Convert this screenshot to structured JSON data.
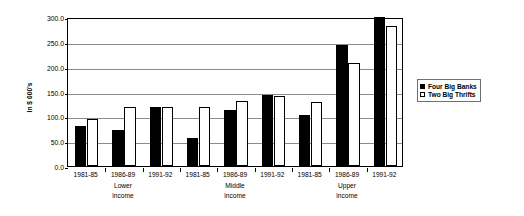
{
  "chart_data": {
    "type": "bar",
    "title": "",
    "subtitle": "",
    "xlabel": "",
    "ylabel": "In $ 000's",
    "ylim": [
      0,
      300
    ],
    "ytick_values": [
      0,
      50,
      100,
      150,
      200,
      250,
      300
    ],
    "ytick_labels": [
      "0.0",
      "50.0",
      "100.0",
      "150.0",
      "200.0",
      "250.0",
      "300.0"
    ],
    "grid": true,
    "legend_position": "right",
    "categories": [
      "1981-85",
      "1986-89",
      "1991-92",
      "1981-85",
      "1986-89",
      "1991-92",
      "1981-85",
      "1986-89",
      "1991-92"
    ],
    "groups": [
      {
        "label_line1": "Lower",
        "label_line2": "income",
        "categories": [
          "1981-85",
          "1986-89",
          "1991-92"
        ]
      },
      {
        "label_line1": "Middle",
        "label_line2": "income",
        "categories": [
          "1981-85",
          "1986-89",
          "1991-92"
        ]
      },
      {
        "label_line1": "Upper",
        "label_line2": "income",
        "categories": [
          "1981-85",
          "1986-89",
          "1991-92"
        ]
      }
    ],
    "series": [
      {
        "name": "Four Big Banks",
        "color": "#000000",
        "style": "filled",
        "values": [
          80,
          72,
          118,
          57,
          112,
          143,
          102,
          244,
          305
        ]
      },
      {
        "name": "Two Big Thrifts",
        "color": "#ffffff",
        "style": "outlined",
        "values": [
          95,
          118,
          118,
          118,
          131,
          141,
          128,
          207,
          282
        ]
      }
    ]
  },
  "legend": {
    "entries": [
      {
        "label": "Four Big Banks",
        "swatch": "filled-square"
      },
      {
        "label": "Two Big Thrifts",
        "swatch": "outlined-square"
      }
    ]
  },
  "colors": {
    "axis": "#000000",
    "grid": "#8a8a8a",
    "background": "#ffffff",
    "series_dark": "#000000",
    "series_light": "#ffffff"
  }
}
